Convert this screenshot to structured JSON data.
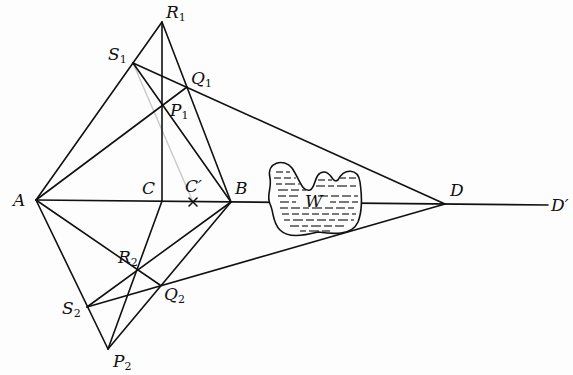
{
  "figure": {
    "type": "geometric construction diagram",
    "background": "#fdfdfd",
    "stroke_color": "#111111",
    "points": {
      "A": {
        "x": 36,
        "y": 200,
        "label": "A",
        "sub": ""
      },
      "B": {
        "x": 231,
        "y": 202,
        "label": "B",
        "sub": ""
      },
      "C": {
        "x": 162,
        "y": 201,
        "label": "C",
        "sub": ""
      },
      "Cp": {
        "x": 193,
        "y": 202,
        "label": "C′",
        "sub": ""
      },
      "D": {
        "x": 445,
        "y": 204,
        "label": "D",
        "sub": ""
      },
      "Dp": {
        "x": 548,
        "y": 205,
        "label": "D′",
        "sub": ""
      },
      "R1": {
        "x": 162,
        "y": 22,
        "label": "R",
        "sub": "1"
      },
      "S1": {
        "x": 133,
        "y": 63,
        "label": "S",
        "sub": "1"
      },
      "Q1": {
        "x": 187,
        "y": 87,
        "label": "Q",
        "sub": "1"
      },
      "P1": {
        "x": 162,
        "y": 106,
        "label": "P",
        "sub": "1"
      },
      "R2": {
        "x": 137,
        "y": 272,
        "label": "R",
        "sub": "2"
      },
      "Q2": {
        "x": 160,
        "y": 285,
        "label": "Q",
        "sub": "2"
      },
      "S2": {
        "x": 87,
        "y": 307,
        "label": "S",
        "sub": "2"
      },
      "P2": {
        "x": 108,
        "y": 349,
        "label": "P",
        "sub": "2"
      }
    },
    "segments": [
      [
        "A",
        "Dp"
      ],
      [
        "A",
        "R1"
      ],
      [
        "A",
        "Q1"
      ],
      [
        "S1",
        "D"
      ],
      [
        "S1",
        "B"
      ],
      [
        "R1",
        "B"
      ],
      [
        "R1",
        "C"
      ],
      [
        "A",
        "P2"
      ],
      [
        "A",
        "Q2"
      ],
      [
        "S2",
        "D"
      ],
      [
        "S2",
        "B"
      ],
      [
        "P2",
        "B"
      ],
      [
        "C",
        "P2"
      ]
    ],
    "faint_segments": [
      [
        "S1",
        "Cp"
      ]
    ],
    "obstacle": {
      "label": "W"
    },
    "labels": {
      "A": "A",
      "B": "B",
      "C": "C",
      "Cp": "C′",
      "D": "D",
      "Dp": "D′",
      "W": "W",
      "R": "R",
      "S": "S",
      "Q": "Q",
      "P": "P",
      "one": "1",
      "two": "2"
    }
  }
}
